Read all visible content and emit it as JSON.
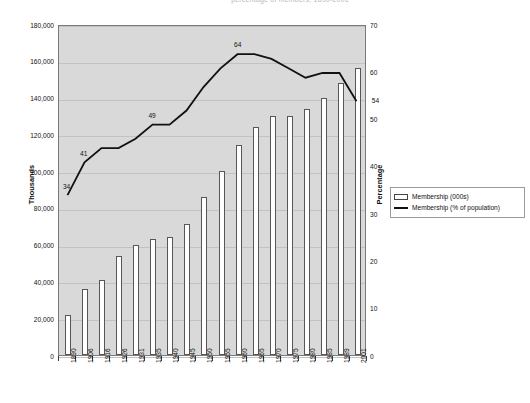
{
  "title_partial": "percentage of members, 1890-2001",
  "axis": {
    "left_title": "Thousands",
    "right_title": "Percentage",
    "left_ticks": [
      "0",
      "20,000",
      "40,000",
      "60,000",
      "80,000",
      "100,000",
      "120,000",
      "140,000",
      "160,000",
      "180,000"
    ],
    "right_ticks": [
      "0",
      "10",
      "20",
      "30",
      "40",
      "50",
      "60",
      "70"
    ]
  },
  "legend": {
    "items": [
      {
        "label": "Membership (000s)",
        "marker": "box-swatch"
      },
      {
        "label": "Membership (% of population)",
        "marker": "line-swatch"
      }
    ]
  },
  "chart_data": {
    "type": "bar",
    "title": "",
    "xlabel": "",
    "ylabel": "Thousands",
    "y2label": "Percentage",
    "grid": true,
    "legend_position": "right",
    "ylim": [
      0,
      180000
    ],
    "y2lim": [
      0,
      70
    ],
    "categories": [
      "1890",
      "1906",
      "1916",
      "1926",
      "1931",
      "1935",
      "1940",
      "1945",
      "1950",
      "1955",
      "1960",
      "1965",
      "1970",
      "1975",
      "1980",
      "1985",
      "1989",
      "2001"
    ],
    "series": [
      {
        "name": "Membership (000s)",
        "type": "bar",
        "axis": "left",
        "values": [
          22000,
          36000,
          41000,
          54000,
          60000,
          63000,
          64000,
          71000,
          86000,
          100000,
          114000,
          124000,
          130000,
          130000,
          134000,
          140000,
          148000,
          156000
        ]
      },
      {
        "name": "Membership (% of population)",
        "type": "line",
        "axis": "right",
        "values": [
          34,
          41,
          44,
          44,
          46,
          49,
          49,
          52,
          57,
          61,
          64,
          64,
          63,
          61,
          59,
          60,
          60,
          54
        ],
        "point_labels": [
          {
            "category": "1890",
            "value": 34,
            "text": "34"
          },
          {
            "category": "1906",
            "value": 41,
            "text": "41"
          },
          {
            "category": "1935",
            "value": 49,
            "text": "49"
          },
          {
            "category": "1960",
            "value": 64,
            "text": "64"
          },
          {
            "category": "2001",
            "value": 54,
            "text": "54"
          }
        ]
      }
    ]
  },
  "colors": {
    "plot_background": "#d9d9d9",
    "bar_fill": "#ffffff",
    "bar_border": "#575757",
    "line": "#111111",
    "grid": "#c2c2c2",
    "frame": "#7a7a7a"
  }
}
